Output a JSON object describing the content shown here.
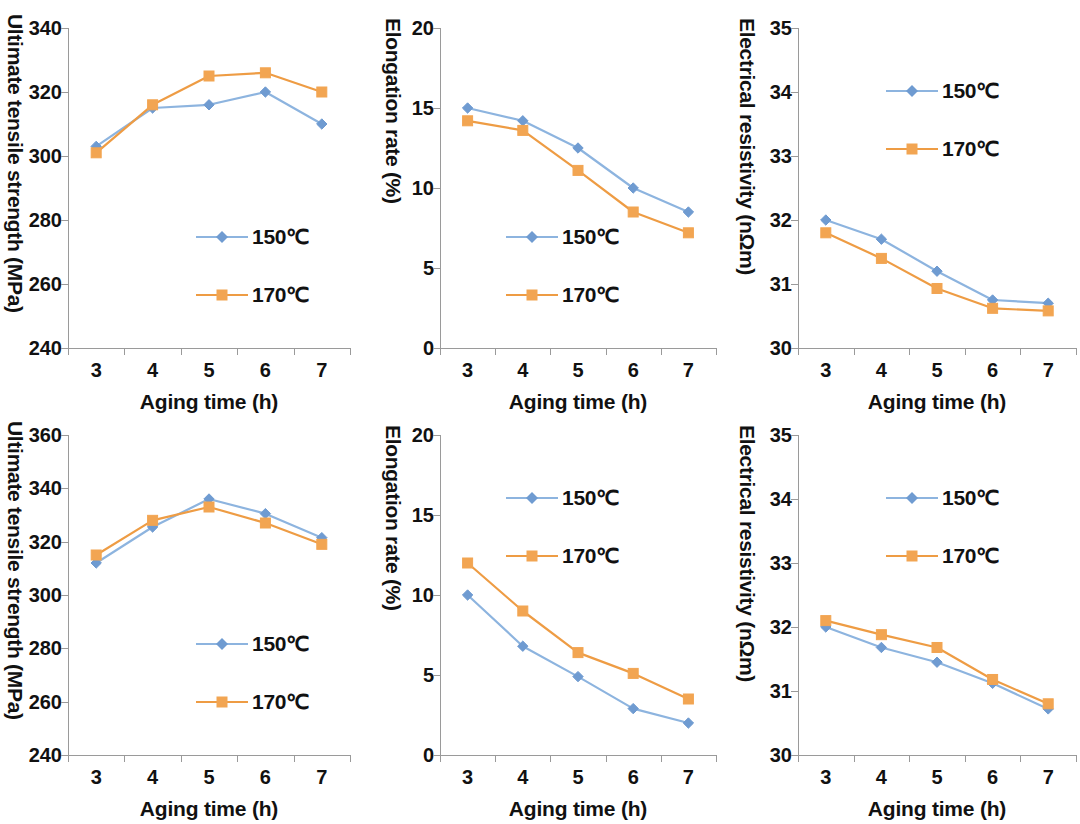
{
  "figure": {
    "series_names": [
      "150℃",
      "170ℓ"
    ],
    "legend": {
      "s150": "150℃",
      "s170": "170℃"
    },
    "colors": {
      "s150": "#8DB4DF",
      "s150_marker": "#6F9BD1",
      "s170": "#EE9C44",
      "s170_marker": "#F2A552",
      "axis": "#9a9a9a",
      "text": "#111111"
    },
    "xaxis": {
      "title": "Aging time (h)",
      "ticks": [
        "3",
        "4",
        "5",
        "6",
        "7"
      ],
      "categories": [
        3,
        4,
        5,
        6,
        7
      ]
    }
  },
  "charts": [
    {
      "id": "chart-uts-top",
      "position": "top-left",
      "ytitle": "Ultimate tensile strength (MPa)",
      "yticks": [
        "340",
        "320",
        "300",
        "280",
        "260",
        "240"
      ],
      "ymin": 240,
      "ymax": 340,
      "ystep": 20
    },
    {
      "id": "chart-elongation-top",
      "position": "top-center",
      "ytitle": "Elongation rate (%)",
      "yticks": [
        "20",
        "15",
        "10",
        "5",
        "0"
      ],
      "ymin": 0,
      "ymax": 20,
      "ystep": 5
    },
    {
      "id": "chart-resistivity-top",
      "position": "top-right",
      "ytitle": "Electrical resistivity (nΩm)",
      "yticks": [
        "35",
        "34",
        "33",
        "32",
        "31",
        "30"
      ],
      "ymin": 30,
      "ymax": 35,
      "ystep": 1
    },
    {
      "id": "chart-uts-bottom",
      "position": "bottom-left",
      "ytitle": "Ultimate tensile strength (MPa)",
      "yticks": [
        "360",
        "340",
        "320",
        "300",
        "280",
        "260",
        "240"
      ],
      "ymin": 240,
      "ymax": 360,
      "ystep": 20
    },
    {
      "id": "chart-elongation-bottom",
      "position": "bottom-center",
      "ytitle": "Elongation rate (%)",
      "yticks": [
        "20",
        "15",
        "10",
        "5",
        "0"
      ],
      "ymin": 0,
      "ymax": 20,
      "ystep": 5
    },
    {
      "id": "chart-resistivity-bottom",
      "position": "bottom-right",
      "ytitle": "Electrical resistivity (nΩm)",
      "yticks": [
        "35",
        "34",
        "33",
        "32",
        "31",
        "30"
      ],
      "ymin": 30,
      "ymax": 35,
      "ystep": 1
    }
  ],
  "chart_data": [
    {
      "type": "line",
      "title": "",
      "xlabel": "Aging time (h)",
      "ylabel": "Ultimate tensile strength (MPa)",
      "x": [
        3,
        4,
        5,
        6,
        7
      ],
      "xticklabels": [
        "3",
        "4",
        "5",
        "6",
        "7"
      ],
      "ylim": [
        240,
        340
      ],
      "ytick": [
        240,
        260,
        280,
        300,
        320,
        340
      ],
      "grid": false,
      "legend_position": "center-right",
      "series": [
        {
          "name": "150℃",
          "values": [
            303,
            315,
            316,
            320,
            310
          ]
        },
        {
          "name": "170℃",
          "values": [
            301,
            316,
            325,
            326,
            320
          ]
        }
      ]
    },
    {
      "type": "line",
      "title": "",
      "xlabel": "Aging time (h)",
      "ylabel": "Elongation rate (%)",
      "x": [
        3,
        4,
        5,
        6,
        7
      ],
      "xticklabels": [
        "3",
        "4",
        "5",
        "6",
        "7"
      ],
      "ylim": [
        0,
        20
      ],
      "ytick": [
        0,
        5,
        10,
        15,
        20
      ],
      "grid": false,
      "legend_position": "center-left",
      "series": [
        {
          "name": "150℃",
          "values": [
            15.0,
            14.2,
            12.5,
            10.0,
            8.5
          ]
        },
        {
          "name": "170℃",
          "values": [
            14.2,
            13.6,
            11.1,
            8.5,
            7.2
          ]
        }
      ]
    },
    {
      "type": "line",
      "title": "",
      "xlabel": "Aging time (h)",
      "ylabel": "Electrical resistivity (nΩm)",
      "x": [
        3,
        4,
        5,
        6,
        7
      ],
      "xticklabels": [
        "3",
        "4",
        "5",
        "6",
        "7"
      ],
      "ylim": [
        30,
        35
      ],
      "ytick": [
        30,
        31,
        32,
        33,
        34,
        35
      ],
      "grid": false,
      "legend_position": "upper-center",
      "series": [
        {
          "name": "150℃",
          "values": [
            32.0,
            31.7,
            31.2,
            30.75,
            30.7
          ]
        },
        {
          "name": "170℃",
          "values": [
            31.8,
            31.4,
            30.93,
            30.62,
            30.58
          ]
        }
      ]
    },
    {
      "type": "line",
      "title": "",
      "xlabel": "Aging time (h)",
      "ylabel": "Ultimate tensile strength (MPa)",
      "x": [
        3,
        4,
        5,
        6,
        7
      ],
      "xticklabels": [
        "3",
        "4",
        "5",
        "6",
        "7"
      ],
      "ylim": [
        240,
        360
      ],
      "ytick": [
        240,
        260,
        280,
        300,
        320,
        340,
        360
      ],
      "grid": false,
      "legend_position": "center-right",
      "series": [
        {
          "name": "150℃",
          "values": [
            312,
            325.5,
            336,
            330.5,
            321.5
          ]
        },
        {
          "name": "170℃",
          "values": [
            315,
            328,
            333,
            327,
            319
          ]
        }
      ]
    },
    {
      "type": "line",
      "title": "",
      "xlabel": "Aging time (h)",
      "ylabel": "Elongation rate (%)",
      "x": [
        3,
        4,
        5,
        6,
        7
      ],
      "xticklabels": [
        "3",
        "4",
        "5",
        "6",
        "7"
      ],
      "ylim": [
        0,
        20
      ],
      "ytick": [
        0,
        5,
        10,
        15,
        20
      ],
      "grid": false,
      "legend_position": "upper-center",
      "series": [
        {
          "name": "150℃",
          "values": [
            10.0,
            6.8,
            4.9,
            2.9,
            2.0
          ]
        },
        {
          "name": "170℃",
          "values": [
            12.0,
            9.0,
            6.4,
            5.1,
            3.5
          ]
        }
      ]
    },
    {
      "type": "line",
      "title": "",
      "xlabel": "Aging time (h)",
      "ylabel": "Electrical resistivity (nΩm)",
      "x": [
        3,
        4,
        5,
        6,
        7
      ],
      "xticklabels": [
        "3",
        "4",
        "5",
        "6",
        "7"
      ],
      "ylim": [
        30,
        35
      ],
      "ytick": [
        30,
        31,
        32,
        33,
        34,
        35
      ],
      "grid": false,
      "legend_position": "upper-center",
      "series": [
        {
          "name": "150℃",
          "values": [
            32.0,
            31.68,
            31.45,
            31.12,
            30.72
          ]
        },
        {
          "name": "170℃",
          "values": [
            32.1,
            31.88,
            31.68,
            31.18,
            30.8
          ]
        }
      ]
    }
  ],
  "layout": [
    {
      "left": 0,
      "top": 8,
      "plotLeft": 68,
      "plotTop": 20,
      "plotW": 282,
      "plotH": 320,
      "legLeft": 196,
      "legTop": 214
    },
    {
      "left": 376,
      "top": 8,
      "plotLeft": 440,
      "plotTop": 20,
      "plotW": 276,
      "plotH": 320,
      "legLeft": 506,
      "legTop": 214
    },
    {
      "left": 730,
      "top": 8,
      "plotLeft": 798,
      "plotTop": 20,
      "plotW": 278,
      "plotH": 320,
      "legLeft": 886,
      "legTop": 68
    },
    {
      "left": 0,
      "top": 415,
      "plotLeft": 68,
      "plotTop": 20,
      "plotW": 282,
      "plotH": 320,
      "legLeft": 196,
      "legTop": 214
    },
    {
      "left": 376,
      "top": 415,
      "plotLeft": 440,
      "plotTop": 20,
      "plotW": 276,
      "plotH": 320,
      "legLeft": 506,
      "legTop": 68
    },
    {
      "left": 730,
      "top": 415,
      "plotLeft": 798,
      "plotTop": 20,
      "plotW": 278,
      "plotH": 320,
      "legLeft": 886,
      "legTop": 68
    }
  ]
}
